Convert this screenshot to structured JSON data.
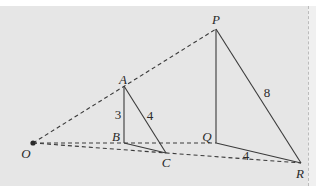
{
  "figure": {
    "points": {
      "O": {
        "label": "O",
        "x": 33,
        "y": 143
      },
      "A": {
        "label": "A",
        "x": 124,
        "y": 86
      },
      "B": {
        "label": "B",
        "x": 124,
        "y": 143
      },
      "C": {
        "label": "C",
        "x": 166,
        "y": 153
      },
      "P": {
        "label": "P",
        "x": 216,
        "y": 29
      },
      "Q": {
        "label": "Q",
        "x": 216,
        "y": 143
      },
      "R": {
        "label": "R",
        "x": 301,
        "y": 163
      }
    },
    "lengths": {
      "AB": "3",
      "AC": "4",
      "PR": "8",
      "QR": "4"
    },
    "colors": {
      "background": "#e6e6e6",
      "line": "#3a3a3a"
    }
  }
}
